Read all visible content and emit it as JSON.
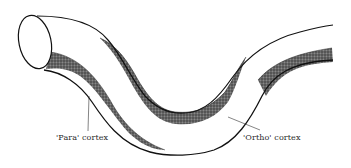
{
  "diagram": {
    "labels": {
      "para": "'Para' cortex",
      "ortho": "'Ortho' cortex"
    },
    "colors": {
      "outline": "#111111",
      "shading": "#5a5a5a",
      "background": "#ffffff"
    }
  }
}
